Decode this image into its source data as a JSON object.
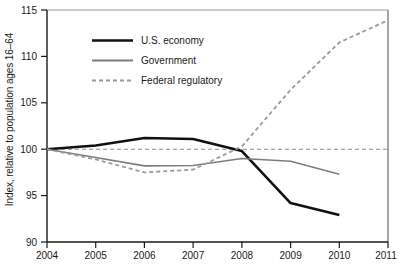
{
  "chart_data": {
    "type": "line",
    "title": "",
    "xlabel": "",
    "ylabel": "Index, relative to population ages 16–64",
    "xlim": [
      2004,
      2011
    ],
    "ylim": [
      90,
      115
    ],
    "grid": false,
    "legend_position": "upper-left-inside",
    "x_ticks": [
      "2004",
      "2005",
      "2006",
      "2007",
      "2008",
      "2009",
      "2010",
      "2011"
    ],
    "y_ticks": [
      "90",
      "95",
      "100",
      "105",
      "110",
      "115"
    ],
    "reference_line": {
      "name": "baseline-100",
      "value": 100,
      "style": "dashed",
      "color": "#8c8c8c"
    },
    "series": [
      {
        "name": "U.S. economy",
        "color": "#111111",
        "style": "solid",
        "width": 2.6,
        "x": [
          2004,
          2005,
          2006,
          2007,
          2008,
          2009,
          2010
        ],
        "values": [
          100,
          100.4,
          101.2,
          101.1,
          99.8,
          94.2,
          92.9
        ]
      },
      {
        "name": "Government",
        "color": "#7d7d7d",
        "style": "solid",
        "width": 1.6,
        "x": [
          2004,
          2005,
          2006,
          2007,
          2008,
          2009,
          2010
        ],
        "values": [
          100,
          99.1,
          98.2,
          98.25,
          99.0,
          98.7,
          97.3
        ]
      },
      {
        "name": "Federal regulatory",
        "color": "#9a9a9a",
        "style": "dashed",
        "width": 1.8,
        "x": [
          2004,
          2005,
          2006,
          2007,
          2008,
          2009,
          2010,
          2011
        ],
        "values": [
          100,
          98.9,
          97.5,
          97.8,
          100.3,
          106.4,
          111.5,
          113.9
        ]
      }
    ]
  },
  "legend": {
    "items": [
      {
        "label": "U.S. economy"
      },
      {
        "label": "Government"
      },
      {
        "label": "Federal regulatory"
      }
    ]
  },
  "axis": {
    "y_title": "Index, relative to population ages 16–64",
    "y_ticks": [
      "115",
      "110",
      "105",
      "100",
      "95",
      "90"
    ],
    "x_ticks": [
      "2004",
      "2005",
      "2006",
      "2007",
      "2008",
      "2009",
      "2010",
      "2011"
    ]
  },
  "colors": {
    "axis": "#1a1a1a",
    "economy": "#111111",
    "government": "#7d7d7d",
    "regulatory": "#9a9a9a",
    "background": "#ffffff"
  }
}
